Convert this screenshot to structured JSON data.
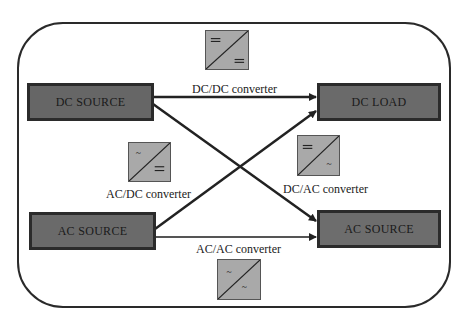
{
  "diagram": {
    "blocks": {
      "dc_source": "DC  SOURCE",
      "ac_source_left": "AC  SOURCE",
      "dc_load": "DC LOAD",
      "ac_source_right": "AC  SOURCE"
    },
    "converters": {
      "dc_dc": {
        "label": "DC/DC converter",
        "input_symbol": "=",
        "output_symbol": "="
      },
      "ac_dc": {
        "label": "AC/DC converter",
        "input_symbol": "~",
        "output_symbol": "="
      },
      "dc_ac": {
        "label": "DC/AC converter",
        "input_symbol": "=",
        "output_symbol": "~"
      },
      "ac_ac": {
        "label": "AC/AC converter",
        "input_symbol": "~",
        "output_symbol": "~"
      }
    },
    "colors": {
      "block_fill": "#6b6b6b",
      "block_border": "#2b2b2b",
      "converter_fill": "#a9a9a9",
      "line": "#222222"
    }
  }
}
